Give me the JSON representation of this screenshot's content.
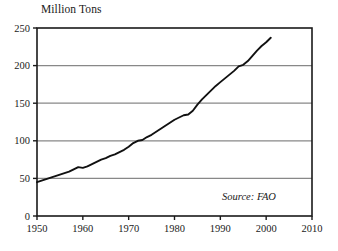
{
  "chart_data": {
    "type": "line",
    "title": "Million Tons",
    "xlabel": "",
    "ylabel": "Million Tons",
    "xlim": [
      1950,
      2010
    ],
    "ylim": [
      0,
      250
    ],
    "xticks": [
      1950,
      1960,
      1970,
      1980,
      1990,
      2000,
      2010
    ],
    "yticks": [
      0,
      50,
      100,
      150,
      200,
      250
    ],
    "grid": "horizontal",
    "legend": "none",
    "annotations": [
      {
        "text": "Source: FAO",
        "position": "bottom-right-inside",
        "style": "italic"
      }
    ],
    "series": [
      {
        "name": "Production",
        "color": "#111111",
        "x": [
          1950,
          1951,
          1952,
          1953,
          1954,
          1955,
          1956,
          1957,
          1958,
          1959,
          1960,
          1961,
          1962,
          1963,
          1964,
          1965,
          1966,
          1967,
          1968,
          1969,
          1970,
          1971,
          1972,
          1973,
          1974,
          1975,
          1976,
          1977,
          1978,
          1979,
          1980,
          1981,
          1982,
          1983,
          1984,
          1985,
          1986,
          1987,
          1988,
          1989,
          1990,
          1991,
          1992,
          1993,
          1994,
          1995,
          1996,
          1997,
          1998,
          1999,
          2000,
          2001
        ],
        "values": [
          45,
          47,
          49,
          51,
          53,
          55,
          57,
          59,
          62,
          65,
          64,
          66,
          69,
          72,
          75,
          77,
          80,
          82,
          85,
          88,
          92,
          97,
          100,
          101,
          105,
          108,
          112,
          116,
          120,
          124,
          128,
          131,
          134,
          135,
          140,
          148,
          155,
          161,
          167,
          173,
          178,
          183,
          188,
          193,
          199,
          201,
          206,
          213,
          220,
          226,
          231,
          237
        ]
      }
    ]
  },
  "yticks_text": [
    "250",
    "200",
    "150",
    "100",
    "50",
    "0"
  ],
  "xticks_text": [
    "1950",
    "1960",
    "1970",
    "1980",
    "1990",
    "2000",
    "2010"
  ],
  "colors": {
    "line": "#111111",
    "grid": "#888888",
    "frame": "#1a1a1a",
    "background": "#ffffff"
  }
}
